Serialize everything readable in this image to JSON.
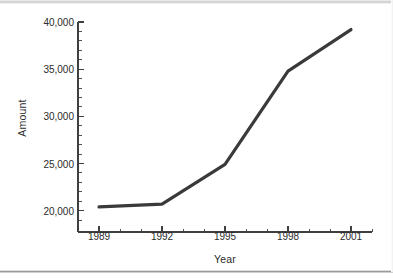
{
  "figure": {
    "background_color": "#ffffff",
    "line_color": "#3a3a3a",
    "axis_color": "#3f3f3f",
    "text_color": "#2b2b2b"
  },
  "chart_data": {
    "type": "line",
    "title": "",
    "xlabel": "Year",
    "ylabel": "Amount",
    "x": [
      1989,
      1992,
      1995,
      1998,
      2001
    ],
    "values": [
      20400,
      20700,
      24900,
      34800,
      39200
    ],
    "categories": [
      "1989",
      "1992",
      "1995",
      "1998",
      "2001"
    ],
    "xlim": [
      1988,
      2002
    ],
    "ylim": [
      18800,
      40000
    ],
    "xticks": [
      "1989",
      "1992",
      "1995",
      "1998",
      "2001"
    ],
    "yticks": [
      "20,000",
      "25,000",
      "30,000",
      "35,000",
      "40,000"
    ],
    "ytick_values": [
      20000,
      25000,
      30000,
      35000,
      40000
    ],
    "minor_ticks_per_interval_y": 5,
    "minor_ticks_per_interval_x": 3,
    "grid": false,
    "legend": false,
    "legend_position": "none",
    "series": [
      {
        "name": "Amount",
        "values": [
          20400,
          20700,
          24900,
          34800,
          39200
        ]
      }
    ]
  }
}
